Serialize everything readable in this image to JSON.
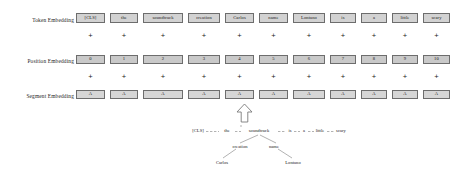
{
  "figure": {
    "kind": "bert-input-embedding-diagram"
  },
  "rows": {
    "token": {
      "label": "Token  Embedding"
    },
    "position": {
      "label": "Position  Embedding"
    },
    "segment": {
      "label": "Segment  Embedding"
    }
  },
  "columns": [
    {
      "token": "[CLS]",
      "position": "0",
      "segment": "A",
      "x": 76,
      "w": 29
    },
    {
      "token": "the",
      "position": "1",
      "segment": "A",
      "x": 110,
      "w": 28
    },
    {
      "token": "soundtrack",
      "position": "2",
      "segment": "A",
      "x": 143,
      "w": 40
    },
    {
      "token": "creation",
      "position": "3",
      "segment": "A",
      "x": 188,
      "w": 32
    },
    {
      "token": "Carlos",
      "position": "4",
      "segment": "A",
      "x": 225,
      "w": 29
    },
    {
      "token": "name",
      "position": "5",
      "segment": "A",
      "x": 259,
      "w": 29
    },
    {
      "token": "Lontano",
      "position": "6",
      "segment": "A",
      "x": 293,
      "w": 32
    },
    {
      "token": "is",
      "position": "7",
      "segment": "A",
      "x": 330,
      "w": 26
    },
    {
      "token": "a",
      "position": "8",
      "segment": "A",
      "x": 361,
      "w": 26
    },
    {
      "token": "little",
      "position": "9",
      "segment": "A",
      "x": 392,
      "w": 26
    },
    {
      "token": "scary",
      "position": "10",
      "segment": "A",
      "x": 423,
      "w": 27
    }
  ],
  "plus_symbol": "+",
  "arrow": {
    "name": "up-arrow",
    "direction": "up"
  },
  "tree": {
    "level0": [
      {
        "text": "[CLS]",
        "x": 198
      },
      {
        "text": "the",
        "x": 227
      },
      {
        "text": "soundtrack",
        "x": 259
      },
      {
        "text": "is",
        "x": 290
      },
      {
        "text": "a",
        "x": 304
      },
      {
        "text": "little",
        "x": 320
      },
      {
        "text": "scary",
        "x": 341
      }
    ],
    "level1": [
      {
        "text": "creation",
        "x": 240
      },
      {
        "text": "name",
        "x": 274
      }
    ],
    "level2": [
      {
        "text": "Carlos",
        "x": 222
      },
      {
        "text": "Lontano",
        "x": 293
      }
    ]
  },
  "colors": {
    "box_fill": "#d2d2d2",
    "box_border": "#6d6d6d",
    "text": "#1b1b1b",
    "background": "#ffffff"
  }
}
